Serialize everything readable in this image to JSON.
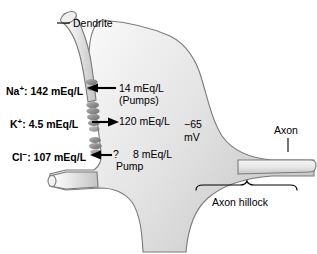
{
  "figure": {
    "background_color": "#ffffff",
    "cell_fill_light": "#f2f2f2",
    "cell_fill_mid": "#d8d8d8",
    "outline_color": "#6e6e6e",
    "channel_color": "#9a9a9a",
    "text_color": "#000000"
  },
  "labels": {
    "dendrite": "Dendrite",
    "axon": "Axon",
    "axon_hillock": "Axon hillock",
    "membrane_potential": "−65\nmV",
    "membrane_potential_value": "−65",
    "membrane_potential_unit": "mV"
  },
  "ions": [
    {
      "name": "Na",
      "charge": "+",
      "inside_value": "142 mEq/L",
      "inside_label": "Na+: 142 mEq/L",
      "outside_value": "14 mEq/L",
      "note": "(Pumps)",
      "arrow_direction": "left",
      "arrow_label": "arrow-left-na"
    },
    {
      "name": "K",
      "charge": "+",
      "inside_value": "4.5 mEq/L",
      "inside_label": "K+: 4.5 mEq/L",
      "outside_value": "120 mEq/L",
      "note": "",
      "arrow_direction": "right",
      "arrow_label": "arrow-right-k"
    },
    {
      "name": "Cl",
      "charge": "−",
      "inside_value": "107 mEq/L",
      "inside_label": "Cl−: 107 mEq/L",
      "outside_value": "8 mEq/L",
      "unknown_marker": "?",
      "note": "Pump",
      "arrow_direction": "left",
      "arrow_label": "arrow-left-cl"
    }
  ],
  "icons": {
    "ion_channel": "ion-channel-bead",
    "leader_line": "leader-line",
    "bracket": "hillock-bracket"
  }
}
